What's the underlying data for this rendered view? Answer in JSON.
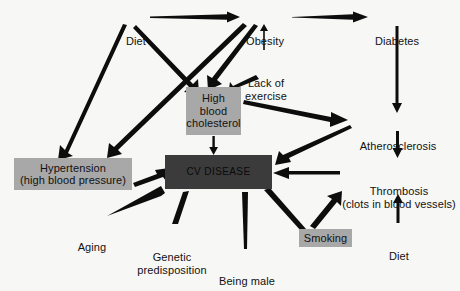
{
  "diagram": {
    "background_color": "#f7f7f5",
    "text_color": "#111111",
    "box_fill_gray": "#a8a8a8",
    "box_fill_dark": "#3b3b3b",
    "nodes": [
      {
        "id": "diet-top",
        "label": "Diet",
        "style": "plain",
        "x": 122,
        "y": 10,
        "w": 28,
        "h": 14
      },
      {
        "id": "obesity",
        "label": "Obesity",
        "style": "plain",
        "x": 243,
        "y": 10,
        "w": 44,
        "h": 14
      },
      {
        "id": "diabetes",
        "label": "Diabetes",
        "style": "plain",
        "x": 371,
        "y": 10,
        "w": 52,
        "h": 14
      },
      {
        "id": "lack-of-exercise",
        "label": "Lack of\nexercise",
        "style": "plain",
        "x": 240,
        "y": 52,
        "w": 52,
        "h": 28
      },
      {
        "id": "high-blood-cholesterol",
        "label": "High\nblood\ncholesterol",
        "style": "boxed",
        "x": 186,
        "y": 87,
        "w": 55,
        "h": 48
      },
      {
        "id": "hypertension",
        "label": "Hypertension\n(high blood pressure)",
        "style": "boxed",
        "x": 14,
        "y": 158,
        "w": 118,
        "h": 32
      },
      {
        "id": "cv-disease",
        "label": "CV DISEASE",
        "style": "dark",
        "x": 165,
        "y": 155,
        "w": 107,
        "h": 34
      },
      {
        "id": "atherosclerosis",
        "label": "Atherosclerosis",
        "style": "plain",
        "x": 355,
        "y": 115,
        "w": 86,
        "h": 14
      },
      {
        "id": "thrombosis",
        "label": "Thrombosis\n(clots in blood vessels)",
        "style": "plain",
        "x": 340,
        "y": 160,
        "w": 118,
        "h": 28
      },
      {
        "id": "diet-bottom",
        "label": "Diet",
        "style": "plain",
        "x": 385,
        "y": 225,
        "w": 28,
        "h": 14
      },
      {
        "id": "aging",
        "label": "Aging",
        "style": "plain",
        "x": 76,
        "y": 216,
        "w": 32,
        "h": 14
      },
      {
        "id": "genetic-predisposition",
        "label": "Genetic\npredisposition",
        "style": "plain",
        "x": 132,
        "y": 226,
        "w": 80,
        "h": 28
      },
      {
        "id": "being-male",
        "label": "Being male",
        "style": "plain",
        "x": 216,
        "y": 250,
        "w": 62,
        "h": 14
      },
      {
        "id": "smoking",
        "label": "Smoking",
        "style": "boxed",
        "x": 299,
        "y": 229,
        "w": 53,
        "h": 18
      }
    ],
    "edges": [
      {
        "id": "diet-to-obesity",
        "from": "diet-top",
        "to": "obesity",
        "weight": "thick"
      },
      {
        "id": "obesity-to-diabetes",
        "from": "obesity",
        "to": "diabetes",
        "weight": "thick"
      },
      {
        "id": "lack-of-exercise-to-obesity",
        "from": "lack-of-exercise",
        "to": "obesity",
        "weight": "medium"
      },
      {
        "id": "diet-to-high-cholesterol",
        "from": "diet-top",
        "to": "high-blood-cholesterol",
        "weight": "thick"
      },
      {
        "id": "obesity-to-high-cholesterol",
        "from": "obesity",
        "to": "high-blood-cholesterol",
        "weight": "thick"
      },
      {
        "id": "lack-of-exercise-to-cholesterol",
        "from": "lack-of-exercise",
        "to": "high-blood-cholesterol",
        "weight": "thick"
      },
      {
        "id": "diet-to-hypertension",
        "from": "diet-top",
        "to": "hypertension",
        "weight": "thick"
      },
      {
        "id": "obesity-to-hypertension",
        "from": "obesity",
        "to": "hypertension",
        "weight": "thick"
      },
      {
        "id": "cholesterol-to-atherosclerosis",
        "from": "high-blood-cholesterol",
        "to": "atherosclerosis",
        "weight": "thick"
      },
      {
        "id": "cholesterol-to-cv-disease",
        "from": "high-blood-cholesterol",
        "to": "cv-disease",
        "weight": "medium"
      },
      {
        "id": "hypertension-to-cv-disease",
        "from": "hypertension",
        "to": "cv-disease",
        "weight": "thick"
      },
      {
        "id": "diabetes-to-atherosclerosis",
        "from": "diabetes",
        "to": "atherosclerosis",
        "weight": "medium"
      },
      {
        "id": "atherosclerosis-to-thrombosis",
        "from": "atherosclerosis",
        "to": "thrombosis",
        "weight": "medium"
      },
      {
        "id": "atherosclerosis-to-cv-disease",
        "from": "atherosclerosis",
        "to": "cv-disease",
        "weight": "thick"
      },
      {
        "id": "thrombosis-to-cv-disease",
        "from": "thrombosis",
        "to": "cv-disease",
        "weight": "thick"
      },
      {
        "id": "diet-bottom-to-thrombosis",
        "from": "diet-bottom",
        "to": "thrombosis",
        "weight": "medium"
      },
      {
        "id": "aging-to-cv-disease",
        "from": "aging",
        "to": "cv-disease",
        "weight": "thin"
      },
      {
        "id": "genetic-to-cv-disease",
        "from": "genetic-predisposition",
        "to": "cv-disease",
        "weight": "thin"
      },
      {
        "id": "being-male-to-cv-disease",
        "from": "being-male",
        "to": "cv-disease",
        "weight": "thin"
      },
      {
        "id": "smoking-to-cv-disease",
        "from": "smoking",
        "to": "cv-disease",
        "weight": "thin"
      },
      {
        "id": "smoking-to-thrombosis",
        "from": "smoking",
        "to": "thrombosis",
        "weight": "thick"
      }
    ]
  }
}
